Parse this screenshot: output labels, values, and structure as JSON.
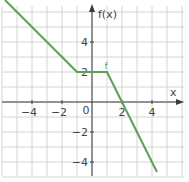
{
  "chart_data": {
    "type": "line",
    "title": "",
    "xlabel": "x",
    "ylabel": "f(x)",
    "function_label": "f",
    "xlim": [
      -6,
      6
    ],
    "ylim": [
      -5,
      6.3
    ],
    "grid": true,
    "x_ticks": [
      -4,
      -2,
      0,
      2,
      4
    ],
    "y_ticks": [
      -4,
      -2,
      2,
      4
    ],
    "origin_label": "0",
    "series": [
      {
        "name": "f",
        "color": "#5e9e56",
        "points": [
          {
            "x": -5.8,
            "y": 6.8
          },
          {
            "x": -1,
            "y": 2
          },
          {
            "x": 1,
            "y": 2
          },
          {
            "x": 4.33,
            "y": -4.67
          }
        ]
      }
    ]
  }
}
